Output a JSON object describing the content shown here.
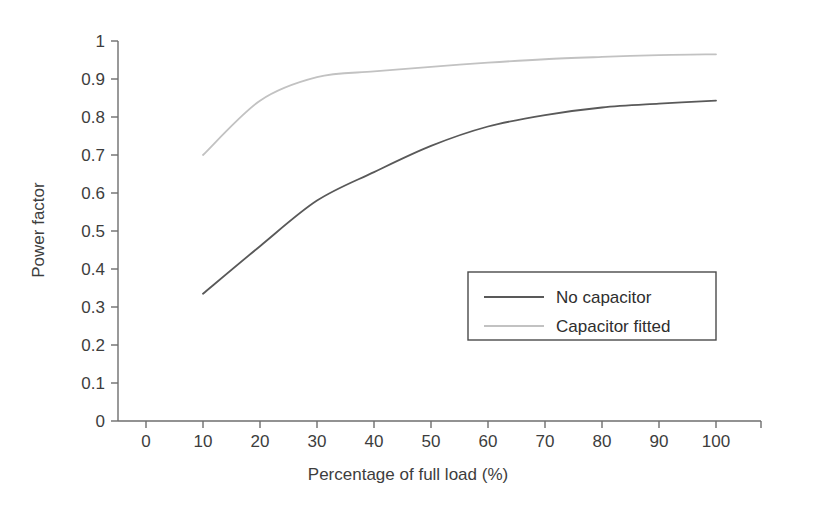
{
  "chart_data": {
    "type": "line",
    "title": "",
    "xlabel": "Percentage of full load (%)",
    "ylabel": "Power factor",
    "xlim": [
      0,
      100
    ],
    "ylim": [
      0,
      1
    ],
    "grid": false,
    "legend_position": "center-right-inside",
    "x_ticks": [
      "0",
      "10",
      "20",
      "30",
      "40",
      "50",
      "60",
      "70",
      "80",
      "90",
      "100"
    ],
    "y_ticks": [
      "0",
      "0.1",
      "0.2",
      "0.3",
      "0.4",
      "0.5",
      "0.6",
      "0.7",
      "0.8",
      "0.9",
      "1"
    ],
    "x": [
      10,
      20,
      30,
      40,
      50,
      60,
      70,
      80,
      90,
      100
    ],
    "series": [
      {
        "name": "No capacitor",
        "color": "#595959",
        "values": [
          0.335,
          0.46,
          0.58,
          0.655,
          0.724,
          0.775,
          0.805,
          0.825,
          0.835,
          0.843
        ]
      },
      {
        "name": "Capacitor fitted",
        "color": "#c2c2c2",
        "values": [
          0.7,
          0.843,
          0.905,
          0.92,
          0.932,
          0.943,
          0.952,
          0.958,
          0.963,
          0.965
        ]
      }
    ]
  },
  "legend": {
    "entries": [
      {
        "label": "No capacitor",
        "color": "#595959"
      },
      {
        "label": "Capacitor fitted",
        "color": "#c2c2c2"
      }
    ]
  },
  "axes": {
    "x_title": "Percentage of full load (%)",
    "y_title": "Power factor",
    "axis_color": "#6e6e6e"
  }
}
